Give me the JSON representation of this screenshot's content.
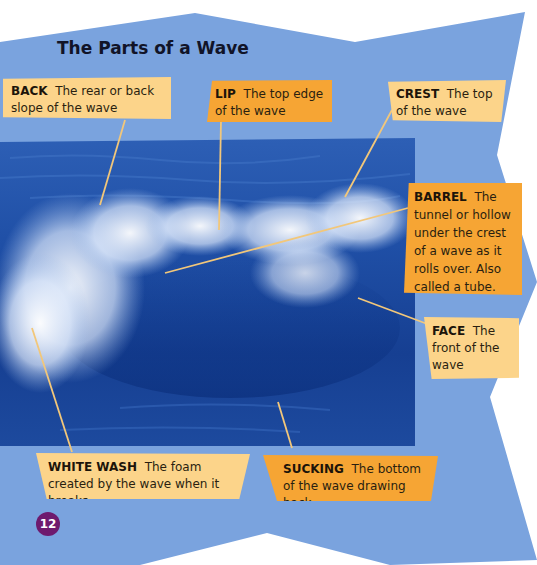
{
  "page": {
    "title": "The Parts of a Wave",
    "page_number": "12"
  },
  "colors": {
    "background_blue": "#7aa3de",
    "label_light": "#fcd48a",
    "label_orange": "#f6a534",
    "leader_line": "#f2c77a",
    "page_badge": "#6e1a6e",
    "title_text": "#111428"
  },
  "photo": {
    "subject": "breaking ocean wave with white foam"
  },
  "labels": [
    {
      "id": "back",
      "term": "BACK",
      "definition": "The rear or back slope of the wave",
      "style": "light"
    },
    {
      "id": "lip",
      "term": "LIP",
      "definition": "The top edge of the wave",
      "style": "orange"
    },
    {
      "id": "crest",
      "term": "CREST",
      "definition": "The top of the wave",
      "style": "light"
    },
    {
      "id": "barrel",
      "term": "BARREL",
      "definition": "The tunnel or hollow under the crest of a wave as it rolls over. Also called a tube.",
      "style": "orange"
    },
    {
      "id": "face",
      "term": "FACE",
      "definition": "The front of the wave",
      "style": "light"
    },
    {
      "id": "white-wash",
      "term": "WHITE WASH",
      "definition": "The foam created by the wave when it breaks",
      "style": "light"
    },
    {
      "id": "sucking",
      "term": "SUCKING",
      "definition": "The bottom of the wave drawing back",
      "style": "orange"
    }
  ]
}
